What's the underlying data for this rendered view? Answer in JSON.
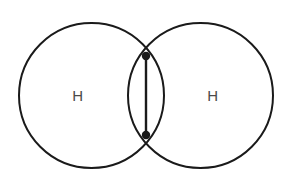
{
  "diagram": {
    "type": "lewis-orbital-overlap",
    "canvas": {
      "width": 290,
      "height": 182,
      "background": "#ffffff"
    },
    "stroke_color": "#1a1a1a",
    "stroke_width": 2,
    "label_color": "#4a4a4a",
    "atoms": [
      {
        "id": "atom-left",
        "label": "H",
        "element": "H",
        "circle": {
          "cx": 91.5,
          "cy": 95.5,
          "r": 72.5
        },
        "label_pos": {
          "x": 78,
          "y": 101
        }
      },
      {
        "id": "atom-right",
        "label": "H",
        "element": "H",
        "circle": {
          "cx": 200.5,
          "cy": 95.5,
          "r": 72.5
        },
        "label_pos": {
          "x": 213,
          "y": 101
        }
      }
    ],
    "bond": {
      "id": "covalent-bond",
      "line": {
        "x1": 146,
        "y1": 56,
        "x2": 146,
        "y2": 135
      },
      "electron_dots": [
        {
          "id": "electron-dot-top",
          "cx": 146,
          "cy": 56,
          "r": 4
        },
        {
          "id": "electron-dot-bottom",
          "cx": 146,
          "cy": 135,
          "r": 4
        }
      ]
    }
  }
}
